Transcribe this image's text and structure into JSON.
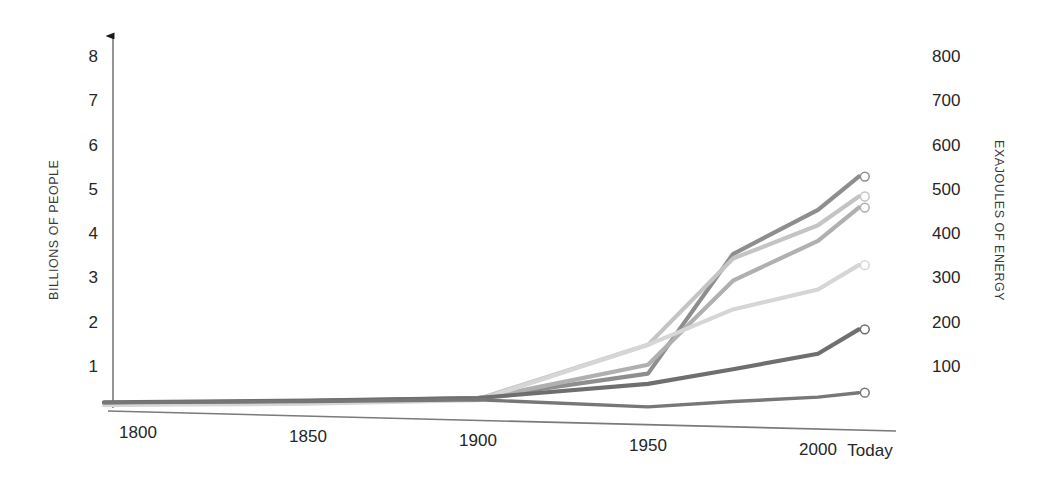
{
  "chart_data": {
    "type": "line",
    "title": "",
    "subtitle": "",
    "xlabel": "",
    "ylabel": "BILLIONS OF PEOPLE",
    "y2label": "EXAJOULES OF ENERGY",
    "grid": false,
    "legend": "none",
    "x": [
      1790,
      1800,
      1850,
      1900,
      1950,
      1975,
      2000,
      2012
    ],
    "xlim": [
      1790,
      2012
    ],
    "xticks": [
      {
        "value": 1800,
        "label": "1800"
      },
      {
        "value": 1850,
        "label": "1850"
      },
      {
        "value": 1900,
        "label": "1900"
      },
      {
        "value": 1950,
        "label": "1950"
      },
      {
        "value": 2000,
        "label": "2000"
      },
      {
        "value": 2012,
        "label": "Today"
      }
    ],
    "ylim": [
      0,
      8.6
    ],
    "yticks": [
      {
        "value": 1,
        "label": "1"
      },
      {
        "value": 2,
        "label": "2"
      },
      {
        "value": 3,
        "label": "3"
      },
      {
        "value": 4,
        "label": "4"
      },
      {
        "value": 5,
        "label": "5"
      },
      {
        "value": 6,
        "label": "6"
      },
      {
        "value": 7,
        "label": "7"
      },
      {
        "value": 8,
        "label": "8"
      }
    ],
    "y2lim": [
      0,
      860
    ],
    "y2ticks": [
      {
        "value": 100,
        "label": "100"
      },
      {
        "value": 200,
        "label": "200"
      },
      {
        "value": 300,
        "label": "300"
      },
      {
        "value": 400,
        "label": "400"
      },
      {
        "value": 500,
        "label": "500"
      },
      {
        "value": 600,
        "label": "600"
      },
      {
        "value": 700,
        "label": "700"
      },
      {
        "value": 800,
        "label": "800"
      }
    ],
    "series": [
      {
        "name": "series-1",
        "axis": "left",
        "color": "#8e8e8e",
        "width": 4.2,
        "endpoint_marker": true,
        "values": [
          0.18,
          0.19,
          0.23,
          0.3,
          0.85,
          3.55,
          4.55,
          5.3
        ]
      },
      {
        "name": "series-2",
        "axis": "left",
        "color": "#c4c4c4",
        "width": 4.2,
        "endpoint_marker": true,
        "values": [
          0.16,
          0.17,
          0.2,
          0.28,
          1.5,
          3.45,
          4.2,
          4.85
        ]
      },
      {
        "name": "series-3",
        "axis": "left",
        "color": "#b0b0b0",
        "width": 4.2,
        "endpoint_marker": true,
        "values": [
          0.15,
          0.16,
          0.19,
          0.27,
          1.05,
          2.95,
          3.85,
          4.6
        ]
      },
      {
        "name": "series-4",
        "axis": "left",
        "color": "#d6d6d6",
        "width": 4.2,
        "endpoint_marker": true,
        "values": [
          0.14,
          0.15,
          0.17,
          0.25,
          1.5,
          2.3,
          2.75,
          3.3
        ]
      },
      {
        "name": "series-5",
        "axis": "left",
        "color": "#6f6f6f",
        "width": 4.2,
        "endpoint_marker": true,
        "values": [
          0.2,
          0.21,
          0.24,
          0.3,
          0.62,
          0.95,
          1.3,
          1.85
        ]
      },
      {
        "name": "series-6",
        "axis": "left",
        "color": "#777777",
        "width": 3.4,
        "endpoint_marker": true,
        "values": [
          0.2,
          0.2,
          0.22,
          0.26,
          0.1,
          0.22,
          0.32,
          0.42
        ]
      }
    ]
  },
  "axes": {
    "left_title": "BILLIONS OF PEOPLE",
    "right_title": "EXAJOULES OF ENERGY",
    "left_ticks": [
      "8",
      "7",
      "6",
      "5",
      "4",
      "3",
      "2",
      "1"
    ],
    "right_ticks": [
      "800",
      "700",
      "600",
      "500",
      "400",
      "300",
      "200",
      "100"
    ],
    "x_ticks": [
      "1800",
      "1850",
      "1900",
      "1950",
      "2000",
      "Today"
    ]
  },
  "colors": {
    "axis_line": "#7a7a7a",
    "arrow": "#1a1a1a",
    "tick_text": "#262626",
    "title_text": "#3a3a3a",
    "background": "#ffffff"
  }
}
